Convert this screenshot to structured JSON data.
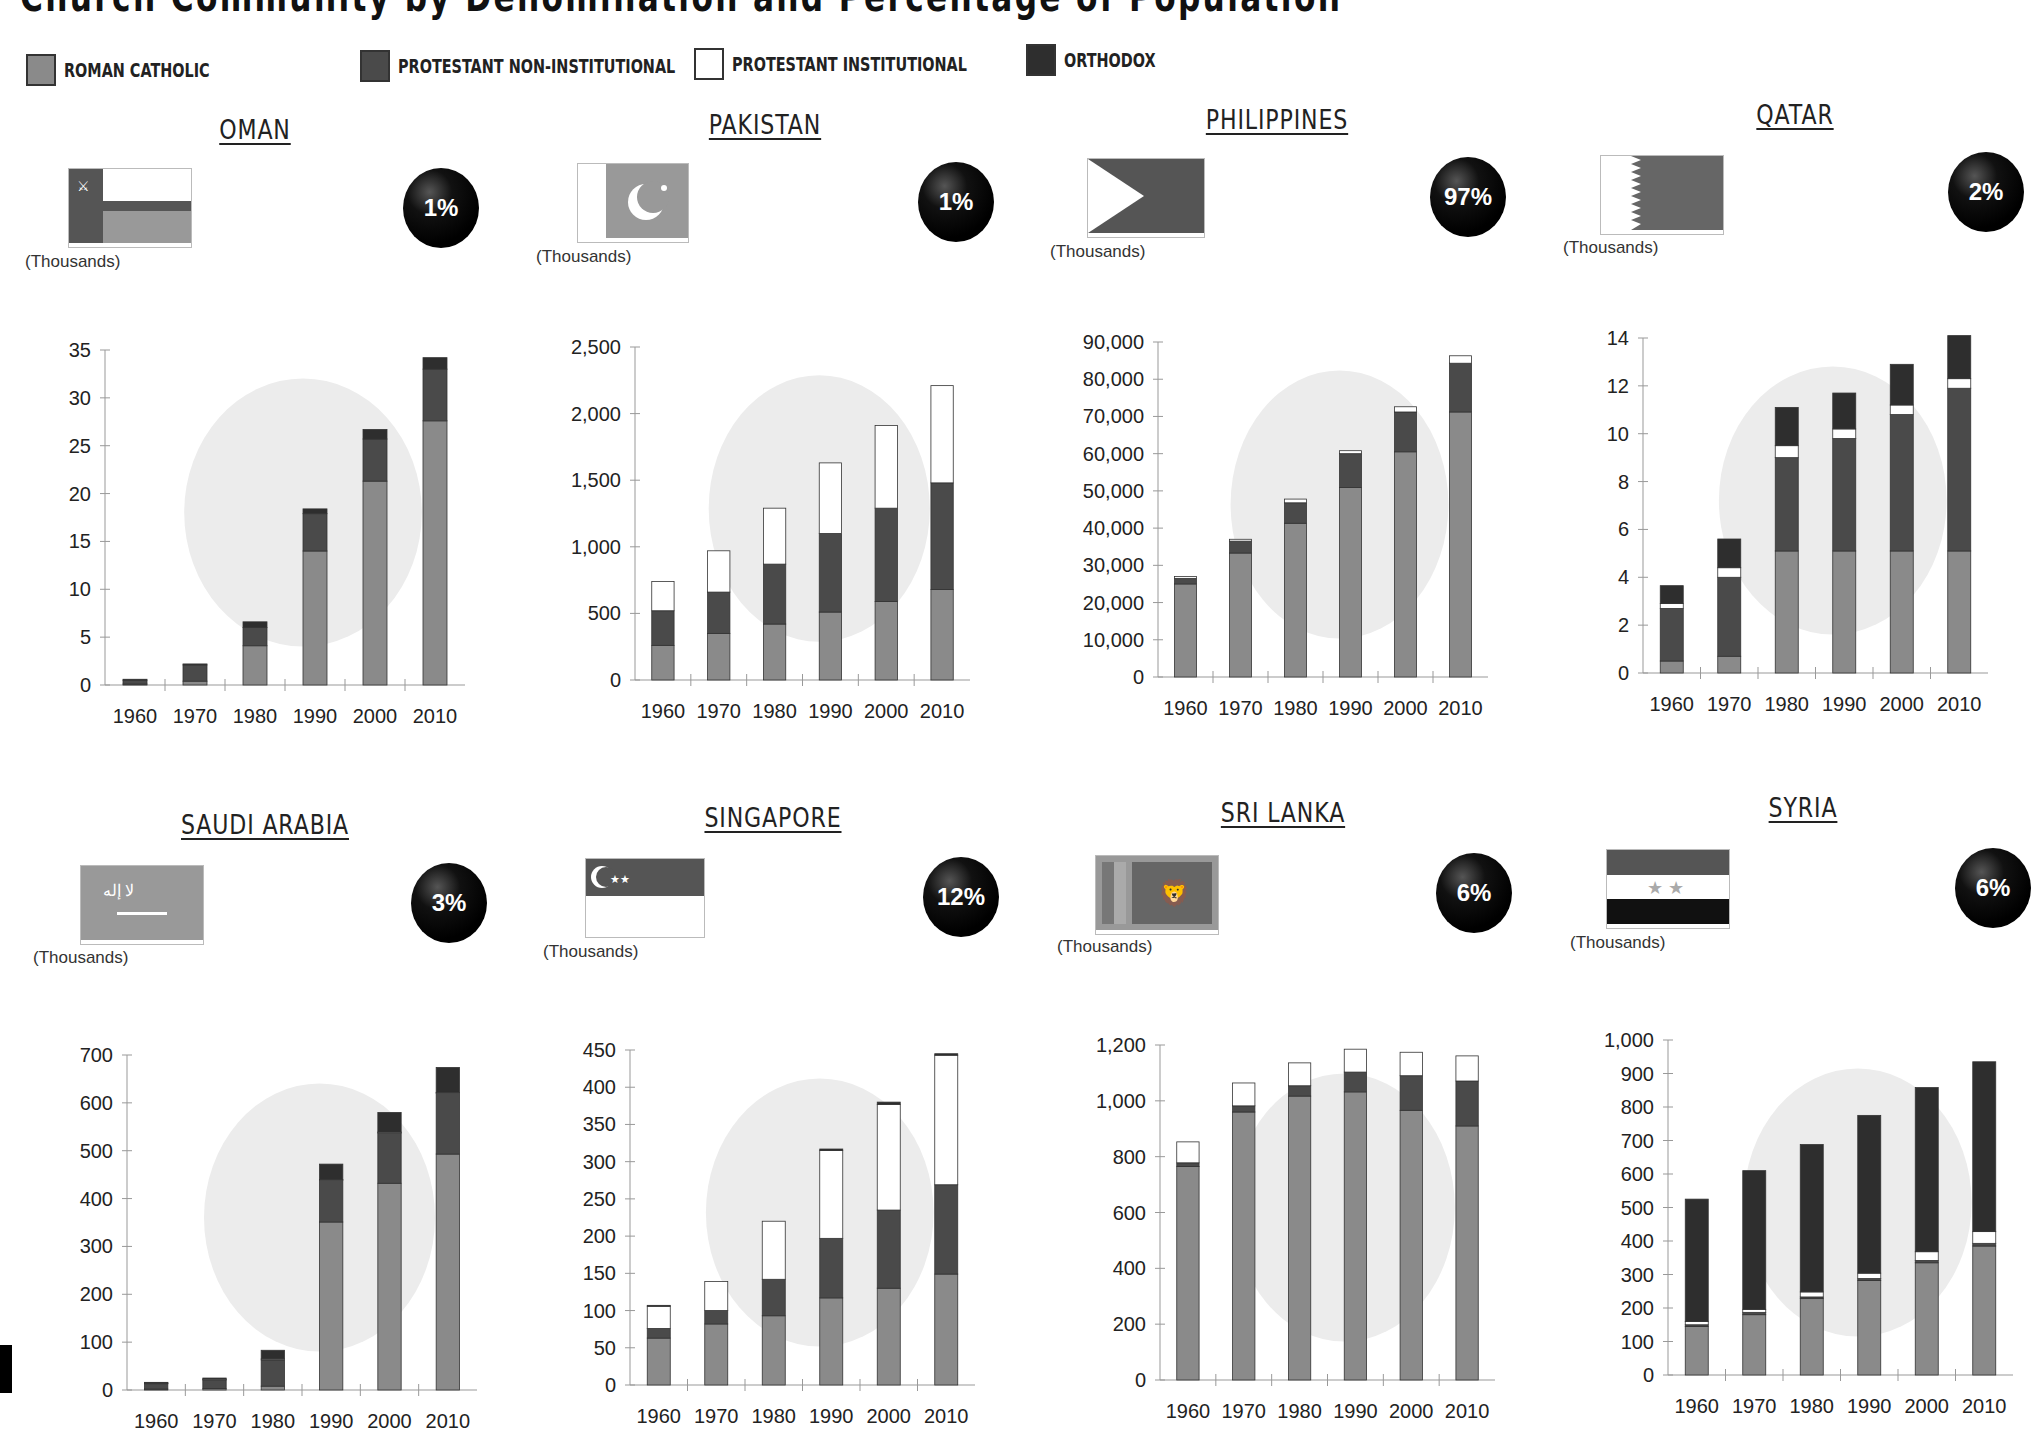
{
  "title": "Church Community by Denomination and Percentage of Population",
  "legend": [
    {
      "label": "ROMAN CATHOLIC",
      "color": "#8a8a8a"
    },
    {
      "label": "PROTESTANT NON-INSTITUTIONAL",
      "color": "#4a4a4a"
    },
    {
      "label": "PROTESTANT INSTITUTIONAL",
      "color": "#ffffff"
    },
    {
      "label": "ORTHODOX",
      "color": "#2e2e2e"
    }
  ],
  "unit_label": "(Thousands)",
  "countries": [
    {
      "name": "OMAN",
      "percent": "1%",
      "flag": "oman-flag"
    },
    {
      "name": "PAKISTAN",
      "percent": "1%",
      "flag": "pakistan-flag"
    },
    {
      "name": "PHILIPPINES",
      "percent": "97%",
      "flag": "philippines-flag"
    },
    {
      "name": "QATAR",
      "percent": "2%",
      "flag": "qatar-flag"
    },
    {
      "name": "SAUDI ARABIA",
      "percent": "3%",
      "flag": "saudi-arabia-flag"
    },
    {
      "name": "SINGAPORE",
      "percent": "12%",
      "flag": "singapore-flag"
    },
    {
      "name": "SRI LANKA",
      "percent": "6%",
      "flag": "sri-lanka-flag"
    },
    {
      "name": "SYRIA",
      "percent": "6%",
      "flag": "syria-flag"
    }
  ],
  "chart_data": [
    {
      "type": "bar",
      "stacked": true,
      "title": "OMAN",
      "ylabel": "(Thousands)",
      "ylim": [
        0,
        35
      ],
      "yticks": [
        0,
        5,
        10,
        15,
        20,
        25,
        30,
        35
      ],
      "ytick_labels": [
        "0",
        "5",
        "10",
        "15",
        "20",
        "25",
        "30",
        "35"
      ],
      "categories": [
        "1960",
        "1970",
        "1980",
        "1990",
        "2000",
        "2010"
      ],
      "series": [
        {
          "name": "Roman Catholic",
          "values": [
            0.1,
            0.4,
            4.1,
            14.0,
            21.3,
            27.6
          ]
        },
        {
          "name": "Protestant Non-Institutional",
          "values": [
            0.4,
            1.7,
            1.9,
            3.9,
            4.4,
            5.4
          ]
        },
        {
          "name": "Protestant Institutional",
          "values": [
            0,
            0,
            0,
            0,
            0,
            0
          ]
        },
        {
          "name": "Orthodox",
          "values": [
            0.1,
            0.1,
            0.6,
            0.5,
            1.0,
            1.2
          ]
        }
      ]
    },
    {
      "type": "bar",
      "stacked": true,
      "title": "PAKISTAN",
      "ylabel": "(Thousands)",
      "ylim": [
        0,
        2500
      ],
      "yticks": [
        0,
        500,
        1000,
        1500,
        2000,
        2500
      ],
      "ytick_labels": [
        "0",
        "500",
        "1,000",
        "1,500",
        "2,000",
        "2,500"
      ],
      "categories": [
        "1960",
        "1970",
        "1980",
        "1990",
        "2000",
        "2010"
      ],
      "series": [
        {
          "name": "Roman Catholic",
          "values": [
            260,
            350,
            420,
            510,
            590,
            680
          ]
        },
        {
          "name": "Protestant Non-Institutional",
          "values": [
            260,
            310,
            450,
            590,
            700,
            800
          ]
        },
        {
          "name": "Protestant Institutional",
          "values": [
            220,
            310,
            420,
            530,
            620,
            730
          ]
        },
        {
          "name": "Orthodox",
          "values": [
            0,
            0,
            0,
            0,
            0,
            0
          ]
        }
      ]
    },
    {
      "type": "bar",
      "stacked": true,
      "title": "PHILIPPINES",
      "ylabel": "(Thousands)",
      "ylim": [
        0,
        90000
      ],
      "yticks": [
        0,
        10000,
        20000,
        30000,
        40000,
        50000,
        60000,
        70000,
        80000,
        90000
      ],
      "ytick_labels": [
        "0",
        "10,000",
        "20,000",
        "30,000",
        "40,000",
        "50,000",
        "60,000",
        "70,000",
        "80,000",
        "90,000"
      ],
      "categories": [
        "1960",
        "1970",
        "1980",
        "1990",
        "2000",
        "2010"
      ],
      "series": [
        {
          "name": "Roman Catholic",
          "values": [
            25000,
            33300,
            41300,
            50900,
            60500,
            71200
          ]
        },
        {
          "name": "Protestant Non-Institutional",
          "values": [
            1500,
            3200,
            5500,
            9100,
            10700,
            13100
          ]
        },
        {
          "name": "Protestant Institutional",
          "values": [
            500,
            500,
            1000,
            800,
            1400,
            2000
          ]
        },
        {
          "name": "Orthodox",
          "values": [
            0,
            0,
            0,
            0,
            0,
            0
          ]
        }
      ]
    },
    {
      "type": "bar",
      "stacked": true,
      "title": "QATAR",
      "ylabel": "(Thousands)",
      "ylim": [
        0,
        14
      ],
      "yticks": [
        0,
        2,
        4,
        6,
        8,
        10,
        12,
        14
      ],
      "ytick_labels": [
        "0",
        "2",
        "4",
        "6",
        "8",
        "10",
        "12",
        "14"
      ],
      "categories": [
        "1960",
        "1970",
        "1980",
        "1990",
        "2000",
        "2010"
      ],
      "series": [
        {
          "name": "Roman Catholic",
          "values": [
            0.5,
            0.7,
            5.1,
            5.1,
            5.1,
            5.1
          ]
        },
        {
          "name": "Protestant Non-Institutional",
          "values": [
            2.2,
            3.3,
            3.9,
            4.7,
            5.7,
            6.8
          ]
        },
        {
          "name": "Protestant Institutional",
          "values": [
            0.2,
            0.4,
            0.5,
            0.4,
            0.4,
            0.4
          ]
        },
        {
          "name": "Orthodox",
          "values": [
            0.75,
            1.2,
            1.6,
            1.5,
            1.7,
            1.8
          ]
        }
      ]
    },
    {
      "type": "bar",
      "stacked": true,
      "title": "SAUDI ARABIA",
      "ylabel": "(Thousands)",
      "ylim": [
        0,
        700
      ],
      "yticks": [
        0,
        100,
        200,
        300,
        400,
        500,
        600,
        700
      ],
      "ytick_labels": [
        "0",
        "100",
        "200",
        "300",
        "400",
        "500",
        "600",
        "700"
      ],
      "categories": [
        "1960",
        "1970",
        "1980",
        "1990",
        "2000",
        "2010"
      ],
      "series": [
        {
          "name": "Roman Catholic",
          "values": [
            2,
            3,
            8,
            351,
            432,
            493
          ]
        },
        {
          "name": "Protestant Non-Institutional",
          "values": [
            12,
            19,
            55,
            88,
            106,
            128
          ]
        },
        {
          "name": "Protestant Institutional",
          "values": [
            1,
            1,
            2,
            1,
            1,
            1
          ]
        },
        {
          "name": "Orthodox",
          "values": [
            1,
            2,
            18,
            32,
            41,
            52
          ]
        }
      ]
    },
    {
      "type": "bar",
      "stacked": true,
      "title": "SINGAPORE",
      "ylabel": "(Thousands)",
      "ylim": [
        0,
        450
      ],
      "yticks": [
        0,
        50,
        100,
        150,
        200,
        250,
        300,
        350,
        400,
        450
      ],
      "ytick_labels": [
        "0",
        "50",
        "100",
        "150",
        "200",
        "250",
        "300",
        "350",
        "400",
        "450"
      ],
      "categories": [
        "1960",
        "1970",
        "1980",
        "1990",
        "2000",
        "2010"
      ],
      "series": [
        {
          "name": "Roman Catholic",
          "values": [
            63,
            82,
            93,
            117,
            130,
            149
          ]
        },
        {
          "name": "Protestant Non-Institutional",
          "values": [
            13,
            18,
            49,
            80,
            105,
            120
          ]
        },
        {
          "name": "Protestant Institutional",
          "values": [
            30,
            39,
            78,
            118,
            142,
            174
          ]
        },
        {
          "name": "Orthodox",
          "values": [
            1,
            0,
            0,
            2,
            3,
            2
          ]
        }
      ]
    },
    {
      "type": "bar",
      "stacked": true,
      "title": "SRI LANKA",
      "ylabel": "(Thousands)",
      "ylim": [
        0,
        1200
      ],
      "yticks": [
        0,
        200,
        400,
        600,
        800,
        1000,
        1200
      ],
      "ytick_labels": [
        "0",
        "200",
        "400",
        "600",
        "800",
        "1,000",
        "1,200"
      ],
      "categories": [
        "1960",
        "1970",
        "1980",
        "1990",
        "2000",
        "2010"
      ],
      "series": [
        {
          "name": "Roman Catholic",
          "values": [
            765,
            960,
            1017,
            1032,
            966,
            910
          ]
        },
        {
          "name": "Protestant Non-Institutional",
          "values": [
            13,
            22,
            37,
            71,
            124,
            161
          ]
        },
        {
          "name": "Protestant Institutional",
          "values": [
            75,
            82,
            82,
            82,
            84,
            90
          ]
        },
        {
          "name": "Orthodox",
          "values": [
            0,
            0,
            0,
            0,
            0,
            0
          ]
        }
      ]
    },
    {
      "type": "bar",
      "stacked": true,
      "title": "SYRIA",
      "ylabel": "(Thousands)",
      "ylim": [
        0,
        1000
      ],
      "yticks": [
        0,
        100,
        200,
        300,
        400,
        500,
        600,
        700,
        800,
        900,
        1000
      ],
      "ytick_labels": [
        "0",
        "100",
        "200",
        "300",
        "400",
        "500",
        "600",
        "700",
        "800",
        "900",
        "1,000"
      ],
      "categories": [
        "1960",
        "1970",
        "1980",
        "1990",
        "2000",
        "2010"
      ],
      "series": [
        {
          "name": "Roman Catholic",
          "values": [
            145,
            180,
            228,
            282,
            335,
            385
          ]
        },
        {
          "name": "Protestant Non-Institutional",
          "values": [
            5,
            7,
            5,
            6,
            7,
            8
          ]
        },
        {
          "name": "Protestant Institutional",
          "values": [
            10,
            9,
            15,
            16,
            26,
            35
          ]
        },
        {
          "name": "Orthodox",
          "values": [
            365,
            414,
            440,
            471,
            490,
            507
          ]
        }
      ]
    }
  ]
}
